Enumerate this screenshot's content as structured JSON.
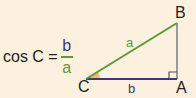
{
  "formula": {
    "lhs": "cos C =",
    "numerator": "b",
    "denominator": "a"
  },
  "vertices": {
    "A": "A",
    "B": "B",
    "C": "C"
  },
  "sides": {
    "a": "a",
    "b": "b"
  },
  "colors": {
    "background": "#fbf1de",
    "hypotenuse": "#5a9a3a",
    "base": "#3a3a6e",
    "vertical": "#9a9a9a",
    "angle": "#f0c060"
  }
}
